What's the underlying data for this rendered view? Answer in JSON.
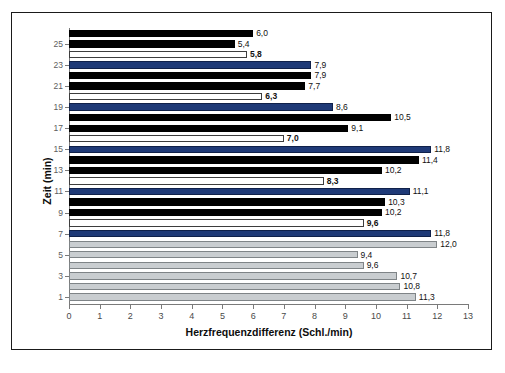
{
  "chart_data": {
    "type": "bar",
    "orientation": "horizontal",
    "title": "",
    "xlabel": "Herzfrequenzdifferenz (Schl./min)",
    "ylabel": "Zeit (min)",
    "xlim": [
      0,
      13
    ],
    "xticks": [
      0,
      1,
      2,
      3,
      4,
      5,
      6,
      7,
      8,
      9,
      10,
      11,
      12,
      13
    ],
    "yticks": [
      1,
      3,
      5,
      7,
      9,
      11,
      13,
      15,
      17,
      19,
      21,
      23,
      25
    ],
    "grid": false,
    "legend": "none",
    "decimal_separator": ",",
    "categories": [
      1,
      2,
      3,
      4,
      5,
      6,
      7,
      8,
      9,
      10,
      11,
      12,
      13,
      14,
      15,
      16,
      17,
      18,
      19,
      20,
      21,
      22,
      23,
      24,
      25,
      26
    ],
    "values": [
      11.3,
      10.8,
      10.7,
      9.6,
      9.4,
      12.0,
      11.8,
      9.6,
      10.2,
      10.3,
      11.1,
      8.3,
      10.2,
      11.4,
      11.8,
      7.0,
      9.1,
      10.5,
      8.6,
      6.3,
      7.7,
      7.9,
      7.9,
      5.8,
      5.4,
      6.0
    ],
    "labels": [
      "11,3",
      "10,8",
      "10,7",
      "9,6",
      "9,4",
      "12,0",
      "11,8",
      "9,6",
      "10,2",
      "10,3",
      "11,1",
      "8,3",
      "10,2",
      "11,4",
      "11,8",
      "7,0",
      "9,1",
      "10,5",
      "8,6",
      "6,3",
      "7,7",
      "7,9",
      "7,9",
      "5,8",
      "5,4",
      "6,0"
    ],
    "bar_styles": [
      "gray",
      "gray",
      "gray",
      "gray",
      "gray",
      "gray",
      "blue",
      "white",
      "black",
      "black",
      "blue",
      "white",
      "black",
      "black",
      "blue",
      "white",
      "black",
      "black",
      "blue",
      "white",
      "black",
      "black",
      "blue",
      "white",
      "black",
      "black"
    ],
    "label_bold": [
      false,
      false,
      false,
      false,
      false,
      false,
      false,
      true,
      false,
      false,
      false,
      true,
      false,
      false,
      false,
      true,
      false,
      false,
      false,
      true,
      false,
      false,
      false,
      true,
      false,
      false
    ],
    "colors": {
      "black": "#010101",
      "blue": "#1f3a77",
      "white": "#ffffff",
      "gray": "#c9cdd0",
      "axis": "#7a7a7a",
      "frame": "#1a1a1a",
      "text": "#111111"
    }
  }
}
